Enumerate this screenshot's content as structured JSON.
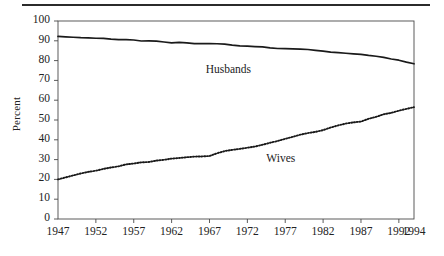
{
  "figure": {
    "top_rule": true,
    "plot_box": {
      "left": 58,
      "right": 414,
      "top": 21,
      "bottom": 219
    }
  },
  "chart_data": {
    "type": "line",
    "title": "",
    "xlabel": "",
    "ylabel": "Percent",
    "xlim": [
      1947,
      1994
    ],
    "ylim": [
      0,
      100
    ],
    "grid": false,
    "legend": "inline-annotations",
    "ytick_labels": [
      "0",
      "10",
      "20",
      "30",
      "40",
      "50",
      "60",
      "70",
      "80",
      "90",
      "100"
    ],
    "ytick_values": [
      0,
      10,
      20,
      30,
      40,
      50,
      60,
      70,
      80,
      90,
      100
    ],
    "xtick_labels": [
      "1947",
      "1952",
      "1957",
      "1962",
      "1967",
      "1972",
      "1977",
      "1982",
      "1987",
      "1992",
      "1994"
    ],
    "xtick_values": [
      1947,
      1952,
      1957,
      1962,
      1967,
      1972,
      1977,
      1982,
      1987,
      1992,
      1994
    ],
    "x": [
      1947,
      1948,
      1949,
      1950,
      1951,
      1952,
      1953,
      1954,
      1955,
      1956,
      1957,
      1958,
      1959,
      1960,
      1961,
      1962,
      1963,
      1964,
      1965,
      1966,
      1967,
      1968,
      1969,
      1970,
      1971,
      1972,
      1973,
      1974,
      1975,
      1976,
      1977,
      1978,
      1979,
      1980,
      1981,
      1982,
      1983,
      1984,
      1985,
      1986,
      1987,
      1988,
      1989,
      1990,
      1991,
      1992,
      1993,
      1994
    ],
    "series": [
      {
        "name": "Husbands",
        "style": "solid",
        "color": "#1a1a1a",
        "label_x": 1966.5,
        "label_y": 75.0,
        "values": [
          92.2,
          92.0,
          91.8,
          91.6,
          91.5,
          91.3,
          91.2,
          90.8,
          90.6,
          90.6,
          90.4,
          89.9,
          90.0,
          89.8,
          89.4,
          89.0,
          89.2,
          89.0,
          88.6,
          88.6,
          88.6,
          88.5,
          88.3,
          87.8,
          87.4,
          87.3,
          87.1,
          86.9,
          86.4,
          86.1,
          86.0,
          85.9,
          85.8,
          85.6,
          85.2,
          84.8,
          84.3,
          84.0,
          83.7,
          83.4,
          83.1,
          82.6,
          82.2,
          81.6,
          80.8,
          80.2,
          79.2,
          78.4
        ]
      },
      {
        "name": "Wives",
        "style": "dotted",
        "color": "#1a1a1a",
        "label_x": 1974.5,
        "label_y": 30.0,
        "values": [
          20.0,
          21.0,
          22.0,
          23.0,
          23.8,
          24.4,
          25.3,
          26.0,
          26.6,
          27.6,
          28.0,
          28.6,
          28.8,
          29.5,
          29.9,
          30.5,
          30.8,
          31.2,
          31.5,
          31.6,
          31.8,
          33.2,
          34.3,
          34.9,
          35.4,
          36.0,
          36.6,
          37.5,
          38.5,
          39.4,
          40.5,
          41.5,
          42.6,
          43.4,
          44.0,
          44.9,
          46.2,
          47.3,
          48.2,
          48.8,
          49.2,
          50.6,
          51.6,
          52.9,
          53.6,
          54.7,
          55.6,
          56.5
        ]
      }
    ]
  }
}
